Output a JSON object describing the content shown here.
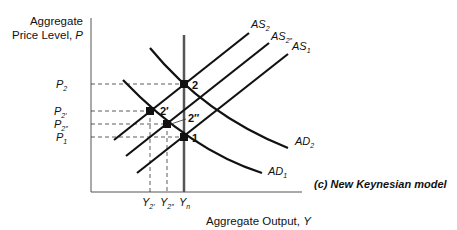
{
  "diagram": {
    "caption": "(c) New Keynesian model",
    "y_axis": {
      "label_line1": "Aggregate",
      "label_line2": "Price Level, ",
      "label_var": "P"
    },
    "x_axis": {
      "label": "Aggregate Output, ",
      "label_var": "Y"
    },
    "price_levels": [
      {
        "base": "P",
        "sub": "2",
        "y": 84
      },
      {
        "base": "P",
        "sub": "2′",
        "y": 111
      },
      {
        "base": "P",
        "sub": "2″",
        "y": 124
      },
      {
        "base": "P",
        "sub": "1",
        "y": 137
      }
    ],
    "output_levels": [
      {
        "base": "Y",
        "sub": "2′",
        "x": 150
      },
      {
        "base": "Y",
        "sub": "2″",
        "x": 167
      },
      {
        "base": "Y",
        "sub": "n",
        "x": 184
      }
    ],
    "curves": {
      "as2": {
        "base": "AS",
        "sub": "2"
      },
      "as2pp": {
        "base": "AS",
        "sub": "2″"
      },
      "as1": {
        "base": "AS",
        "sub": "1"
      },
      "ad2": {
        "base": "AD",
        "sub": "2"
      },
      "ad1": {
        "base": "AD",
        "sub": "1"
      }
    },
    "points": [
      {
        "label": "2",
        "x": 184,
        "y": 84
      },
      {
        "label": "2′",
        "x": 150,
        "y": 111
      },
      {
        "label": "2″",
        "x": 167,
        "y": 124
      },
      {
        "label": "1",
        "x": 184,
        "y": 137
      }
    ]
  }
}
